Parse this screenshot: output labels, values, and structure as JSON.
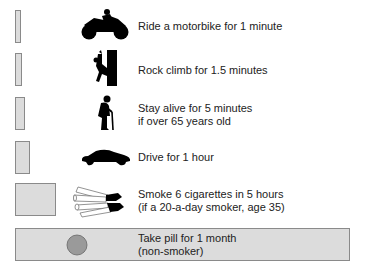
{
  "rows": [
    {
      "label": "Ride a motorbike for 1 minute",
      "icon": "motorbike-icon",
      "bar": {
        "x": 15,
        "y": 10,
        "w": 6,
        "h": 33
      }
    },
    {
      "label": "Rock climb for 1.5 minutes",
      "icon": "rock-climber-icon",
      "bar": {
        "x": 15,
        "y": 53,
        "w": 7,
        "h": 33
      }
    },
    {
      "label": "Stay alive for 5 minutes\nif over 65 years old",
      "icon": "elderly-person-icon",
      "bar": {
        "x": 15,
        "y": 97,
        "w": 10,
        "h": 33
      }
    },
    {
      "label": "Drive for 1 hour",
      "icon": "car-icon",
      "bar": {
        "x": 15,
        "y": 141,
        "w": 15,
        "h": 33
      }
    },
    {
      "label": "Smoke 6 cigarettes in 5 hours\n(if a 20-a-day smoker, age 35)",
      "icon": "cigarettes-icon",
      "bar": {
        "x": 15,
        "y": 183,
        "w": 41,
        "h": 33
      }
    },
    {
      "label": "Take pill for 1 month\n(non-smoker)",
      "icon": "pill-icon",
      "bar": {
        "x": 15,
        "y": 228,
        "w": 335,
        "h": 33
      }
    }
  ],
  "colors": {
    "bar_fill": "#dcdcdc",
    "bar_border": "#8a8a8a",
    "pill": "#9a9a9a",
    "icon": "#000000"
  }
}
